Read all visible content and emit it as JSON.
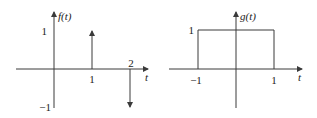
{
  "plots": [
    {
      "id": "f",
      "title": "f(t)",
      "x_axis_label": "t",
      "y_ticks": [
        "1",
        "−1"
      ],
      "x_ticks": [
        "1",
        "2"
      ],
      "impulses": [
        {
          "t": 1,
          "amplitude": 1
        },
        {
          "t": 2,
          "amplitude": -1
        }
      ]
    },
    {
      "id": "g",
      "title": "g(t)",
      "x_axis_label": "t",
      "y_ticks": [
        "1"
      ],
      "x_ticks": [
        "−1",
        "1"
      ],
      "pulse": {
        "start": -1,
        "end": 1,
        "height": 1
      }
    }
  ]
}
